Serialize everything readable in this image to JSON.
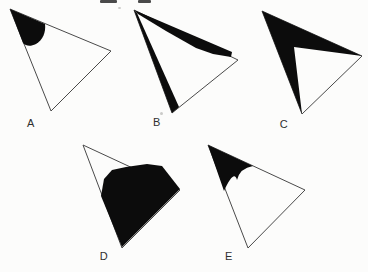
{
  "figure": {
    "kind": "labeled-triangle-options-figure",
    "options": [
      {
        "label": "A",
        "shading": "solid rounded blob filling the top-left corner of the triangle"
      },
      {
        "label": "B",
        "shading": "two thin tapering wedges from the top vertex along the top edge and the left edge"
      },
      {
        "label": "C",
        "shading": "thick chevron / arrowhead band along the top and left edges, white inner triangle against the hypotenuse"
      },
      {
        "label": "D",
        "shading": "large solid blob covering the lower portion, bulging outside the top-right edge, white top-left corner"
      },
      {
        "label": "E",
        "shading": "curved dart with a downward cusp filling the top corner"
      }
    ],
    "colors": {
      "paper": "#fcfcfb",
      "ink": "#0c0c0c",
      "outline": "#4a4a4a",
      "label_text": "#2f2f2f"
    },
    "top_edge_cropped_text_fragments": 2
  }
}
